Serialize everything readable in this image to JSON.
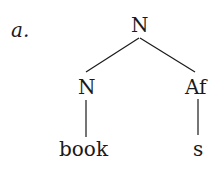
{
  "example_label": "a.",
  "tree": {
    "root": {
      "label": "N"
    },
    "left_child": {
      "label": "N",
      "terminal": "book"
    },
    "right_child": {
      "label": "Af",
      "terminal": "s"
    }
  },
  "colors": {
    "ink": "#1a1a1a",
    "background": "#ffffff"
  }
}
